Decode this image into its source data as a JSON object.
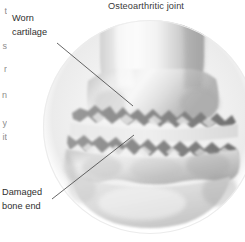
{
  "figure": {
    "title": "Osteoarthritic joint",
    "type": "anatomical-illustration",
    "style": "grayscale airbrush illustration in circular vignette",
    "canvas": {
      "width": 245,
      "height": 242
    }
  },
  "callouts": [
    {
      "id": "worn-cartilage",
      "line1": "Worn",
      "line2": "cartilage",
      "text": "Worn cartilage",
      "label_position": {
        "x": 12,
        "y": 12
      },
      "leader_from": {
        "x": 57,
        "y": 43
      },
      "leader_to": {
        "x": 133,
        "y": 106
      }
    },
    {
      "id": "damaged-bone-end",
      "line1": "Damaged",
      "line2": "bone end",
      "text": "Damaged bone end",
      "label_position": {
        "x": 2,
        "y": 186
      },
      "leader_from": {
        "x": 52,
        "y": 199
      },
      "leader_to": {
        "x": 134,
        "y": 135
      }
    }
  ],
  "edge_fragments": [
    {
      "text": "t",
      "top": 6
    },
    {
      "text": "s",
      "top": 41
    },
    {
      "text": "r",
      "top": 64
    },
    {
      "text": "n",
      "top": 90
    },
    {
      "text": "y",
      "top": 118
    },
    {
      "text": "it",
      "top": 132
    }
  ],
  "illustration": {
    "vignette": {
      "center": {
        "x": 108,
        "y": 108
      },
      "radius": 107,
      "fill_center": "#f3f3f3",
      "fill_edge": "#ffffff",
      "rim": "#e2e2e2"
    },
    "upper_bone": {
      "name": "femoral shaft and condyle",
      "fill_light": "#fbfbfb",
      "fill_mid": "#dcdcdc",
      "fill_shadow": "#b9b9b9"
    },
    "lower_bone": {
      "name": "tibial plateau / damaged bone end",
      "fill_light": "#f0f0f0",
      "fill_mid": "#d4d4d4",
      "fill_shadow": "#a8a8a8"
    },
    "cartilage": {
      "name": "worn articular cartilage",
      "color": "#8e8e8e",
      "color_dark": "#6f6f6f",
      "description": "irregular eroded jagged bands between the bone ends"
    },
    "joint_space": {
      "color": "#e6e6e6"
    },
    "leader_line_color": "#4a4a4a"
  }
}
